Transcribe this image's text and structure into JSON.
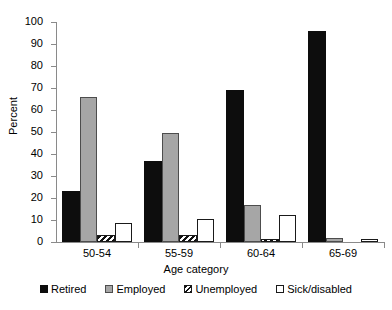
{
  "chart_data": {
    "type": "bar",
    "title": "",
    "xlabel": "Age category",
    "ylabel": "Percent",
    "categories": [
      "50-54",
      "55-59",
      "60-64",
      "65-69"
    ],
    "series": [
      {
        "name": "Retired",
        "color": "#0d0d0d",
        "pattern": "solid-black",
        "values": [
          23,
          37,
          69,
          96
        ]
      },
      {
        "name": "Employed",
        "color": "#a6a6a6",
        "pattern": "solid-gray",
        "values": [
          66,
          49.5,
          17,
          2
        ]
      },
      {
        "name": "Unemployed",
        "color": "#ffffff",
        "pattern": "diagonal-hatch",
        "values": [
          3,
          3,
          1.5,
          0
        ]
      },
      {
        "name": "Sick/disabled",
        "color": "#ffffff",
        "pattern": "outline-white",
        "values": [
          8.5,
          10.5,
          12.5,
          1.5
        ]
      }
    ],
    "ylim": [
      0,
      100
    ],
    "ytick_step": 10,
    "ytick_labels": [
      "0",
      "10",
      "20",
      "30",
      "40",
      "50",
      "60",
      "70",
      "80",
      "90",
      "100"
    ],
    "grid": false,
    "legend_position": "bottom"
  }
}
